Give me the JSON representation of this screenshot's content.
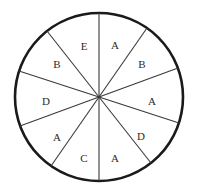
{
  "figure": {
    "kind": "spinner-wheel-diagram",
    "shape": "circle",
    "sector_count": 10,
    "colors": {
      "outline": "#1a1a1a",
      "divider": "#3a3a3a",
      "fill": "#ffffff",
      "label_text": "#2b2b2b",
      "background": "#ffffff"
    },
    "geometry": {
      "center_x": 99,
      "center_y": 97,
      "radius": 84,
      "outline_width": 2.6,
      "divider_width": 1.1,
      "label_radius": 52
    }
  },
  "chart_data": {
    "type": "pie",
    "title": "",
    "xlabel": "",
    "ylabel": "",
    "legend": "none",
    "grid": false,
    "categories": [
      "A",
      "B",
      "A",
      "D",
      "A",
      "C",
      "A",
      "D",
      "B",
      "E"
    ],
    "values": [
      1,
      1,
      1,
      1,
      1,
      1,
      1,
      1,
      1,
      1
    ],
    "sectors": [
      {
        "index": 0,
        "label": "A",
        "start_angle": 90,
        "end_angle": 55,
        "mid_angle": 72.5,
        "label_x": 115,
        "label_y": 46
      },
      {
        "index": 1,
        "label": "B",
        "start_angle": 55,
        "end_angle": 20,
        "mid_angle": 37.5,
        "label_x": 142,
        "label_y": 65
      },
      {
        "index": 2,
        "label": "A",
        "start_angle": 20,
        "end_angle": -18,
        "mid_angle": 1.0,
        "label_x": 152,
        "label_y": 102
      },
      {
        "index": 3,
        "label": "D",
        "start_angle": -18,
        "end_angle": -52,
        "mid_angle": -35.0,
        "label_x": 141,
        "label_y": 137
      },
      {
        "index": 4,
        "label": "A",
        "start_angle": -52,
        "end_angle": -90,
        "mid_angle": -71.0,
        "label_x": 115,
        "label_y": 159
      },
      {
        "index": 5,
        "label": "C",
        "start_angle": -90,
        "end_angle": -125,
        "mid_angle": -107.5,
        "label_x": 84,
        "label_y": 159
      },
      {
        "index": 6,
        "label": "A",
        "start_angle": -125,
        "end_angle": -160,
        "mid_angle": -142.5,
        "label_x": 57,
        "label_y": 138
      },
      {
        "index": 7,
        "label": "D",
        "start_angle": -160,
        "end_angle": 162,
        "mid_angle": -179.0,
        "label_x": 46,
        "label_y": 102
      },
      {
        "index": 8,
        "label": "B",
        "start_angle": 162,
        "end_angle": 128,
        "mid_angle": 145.0,
        "label_x": 57,
        "label_y": 65
      },
      {
        "index": 9,
        "label": "E",
        "start_angle": 128,
        "end_angle": 90,
        "mid_angle": 109.0,
        "label_x": 84,
        "label_y": 47
      }
    ],
    "dividers": [
      {
        "index": 0,
        "angle": 90,
        "x1": 99,
        "y1": 13,
        "x2": 99,
        "y2": 181
      },
      {
        "index": 1,
        "angle": 55,
        "x1": 147,
        "y1": 28,
        "x2": 51,
        "y2": 166
      },
      {
        "index": 2,
        "angle": 20,
        "x1": 178,
        "y1": 68,
        "x2": 20,
        "y2": 126
      },
      {
        "index": 3,
        "angle": -18,
        "x1": 179,
        "y1": 123,
        "x2": 19,
        "y2": 71
      },
      {
        "index": 4,
        "angle": -52,
        "x1": 151,
        "y1": 163,
        "x2": 47,
        "y2": 31
      }
    ],
    "label_counts": {
      "A": 4,
      "B": 2,
      "C": 1,
      "D": 2,
      "E": 1
    }
  }
}
